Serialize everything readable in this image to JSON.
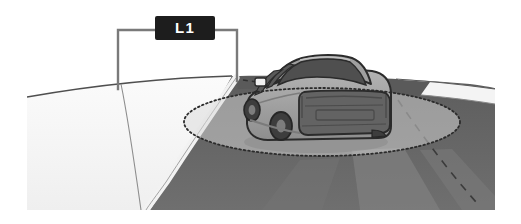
{
  "figure": {
    "name": "vehicle-lane-coverage-illustration",
    "background_color": "#ffffff",
    "canvas": {
      "width": 521,
      "height": 224
    }
  },
  "callout": {
    "label": "L1",
    "badge": {
      "fill_color": "#1d1d1d",
      "text_color": "#ffffff",
      "x": 155,
      "y": 16,
      "width": 60,
      "height": 24,
      "corner_radius": 2
    },
    "leader_lines": {
      "color": "#777777",
      "stroke_width": 2.4,
      "left_bracket": {
        "x_start": 118,
        "y_horizontal": 30,
        "x_vertical": 118,
        "y_end": 89
      },
      "right_bracket": {
        "x_start": 215,
        "y_horizontal": 30,
        "x_vertical": 237,
        "y_end": 81
      }
    }
  },
  "scene": {
    "sky_color": "#ffffff",
    "horizon_line_color": "#555555",
    "shoulder_left_color": "#f2f2f2",
    "shoulder_left_shade_color": "#ededed",
    "road_color": "#6a6a6a",
    "road_dark_color": "#5e5e5e",
    "road_light_patch_color": "#8d8d8d",
    "lane_marking_color": "#ffffff",
    "lane_dash_color": "#3a3a3a",
    "edge_line_color": "#8a8a8a"
  },
  "coverage_zone": {
    "name": "detection-ellipse",
    "shape": "ellipse",
    "center_x": 322,
    "center_y": 122,
    "radius_x": 138,
    "radius_y": 34,
    "fill_color": "#d6d6d6",
    "fill_opacity": 0.55,
    "stroke_color": "#2b2b2b",
    "stroke_dasharray": "1.6 2.6",
    "stroke_width": 1.8
  },
  "vehicle": {
    "name": "sedan-rear-three-quarter",
    "body_color": "#9a9a9a",
    "body_highlight_color": "#b2b2b2",
    "body_shadow_color": "#868686",
    "glass_color": "#5a5a5a",
    "glass_dark_color": "#4c4c4c",
    "bumper_color": "#666666",
    "trim_color": "#555555",
    "outline_color": "#2b2b2b",
    "wheel_color": "#3f3f3f",
    "wheel_hub_color": "#787878",
    "mirror_color": "#f0f0f0",
    "shadow_color": "#8f8f8f",
    "bounds": {
      "x": 238,
      "y": 55,
      "width": 155,
      "height": 92
    }
  }
}
